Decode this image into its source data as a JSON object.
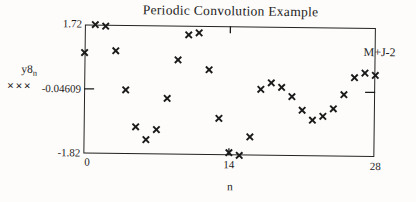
{
  "figure": {
    "title": "Periodic Convolution Example",
    "annotation_marker": "M+J-2",
    "y_axis": {
      "expr_base": "y8",
      "expr_sub": "n",
      "trace_symbols": "×××",
      "top_label": "1.72",
      "mid_label": "-0.04609",
      "bottom_label": "-1.82"
    },
    "x_axis": {
      "label": "n",
      "left_label": "0",
      "mid_label": "14",
      "right_label": "28"
    }
  },
  "chart_data": {
    "type": "scatter",
    "title": "Periodic Convolution Example",
    "xlabel": "n",
    "ylabel": "y8_n",
    "legend_symbol": "×××",
    "marker": "x",
    "marker_color": "#1a1a1a",
    "grid": false,
    "xlim": [
      0,
      28
    ],
    "ylim": [
      -1.82,
      1.72
    ],
    "x_ticks": [
      0,
      14,
      28
    ],
    "y_ticks": [
      -1.82,
      -0.04609,
      1.72
    ],
    "annotations": [
      {
        "text": "M+J-2",
        "position": "top-right"
      }
    ],
    "x": [
      0,
      1,
      2,
      3,
      4,
      5,
      6,
      7,
      8,
      9,
      10,
      11,
      12,
      13,
      14,
      15,
      16,
      17,
      18,
      19,
      20,
      21,
      22,
      23,
      24,
      25,
      26,
      27,
      28
    ],
    "y": [
      0.95,
      1.72,
      1.68,
      1.01,
      -0.06,
      -1.07,
      -1.42,
      -1.14,
      -0.28,
      0.78,
      1.47,
      1.53,
      0.52,
      -0.81,
      -1.75,
      -1.82,
      -1.31,
      0.0,
      0.18,
      0.06,
      -0.19,
      -0.56,
      -0.83,
      -0.72,
      -0.51,
      -0.12,
      0.35,
      0.48,
      0.42
    ]
  }
}
